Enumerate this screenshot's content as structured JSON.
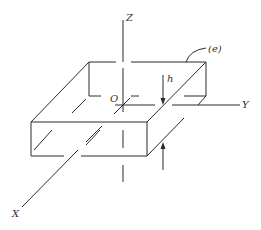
{
  "figure": {
    "type": "isometric plate element with coordinate axes",
    "stroke_color": "#2a2a2a",
    "background": "#ffffff"
  },
  "labels": {
    "z_axis": "Z",
    "y_axis": "Y",
    "x_axis": "X",
    "origin": "O",
    "thickness": "h",
    "element": "(e)"
  }
}
